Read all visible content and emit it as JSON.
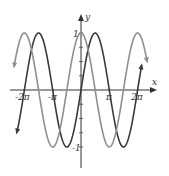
{
  "chart_data": {
    "type": "line",
    "title": "",
    "xlabel": "x",
    "ylabel": "y",
    "xlim": [
      -6.9,
      6.8
    ],
    "ylim": [
      -1.3,
      1.3
    ],
    "grid": false,
    "legend": null,
    "x_tick_labels": [
      "-2π",
      "-π",
      "π",
      "2π"
    ],
    "x_tick_values": [
      -6.2832,
      -3.1416,
      3.1416,
      6.2832
    ],
    "y_tick_labels": [
      "1",
      "-1"
    ],
    "y_tick_values": [
      1,
      -1
    ],
    "series": [
      {
        "name": "sin x",
        "expression": "y = sin x",
        "color": "#3a3a3a",
        "x_range": [
          -7.1,
          6.7
        ]
      },
      {
        "name": "cos x",
        "expression": "y = cos x",
        "color": "#8f8f8f",
        "x_range": [
          -7.4,
          7.3
        ]
      }
    ]
  },
  "labels": {
    "x_axis": "x",
    "y_axis": "y",
    "y_one": "1",
    "y_neg_one": "-1",
    "x_neg_2pi": "-2π",
    "x_neg_pi": "-π",
    "x_pi": "π",
    "x_2pi": "2π"
  }
}
